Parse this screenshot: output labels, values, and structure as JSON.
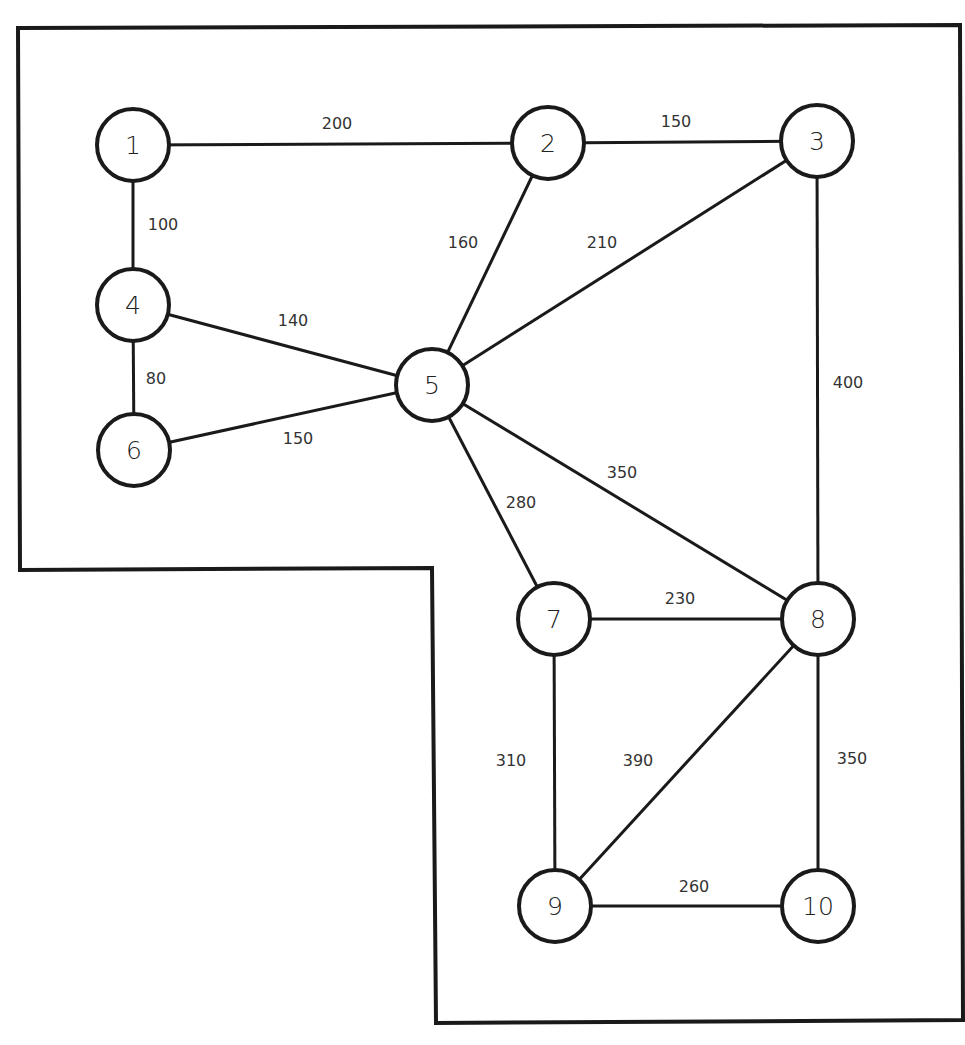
{
  "diagram": {
    "type": "weighted-undirected-graph",
    "colors": {
      "stroke": "#1a1a1a",
      "text": "#333333",
      "background": "#ffffff"
    },
    "boundary": [
      [
        18,
        28
      ],
      [
        960,
        25
      ],
      [
        963,
        1020
      ],
      [
        436,
        1023
      ],
      [
        432,
        568
      ],
      [
        20,
        570
      ]
    ],
    "nodes": [
      {
        "id": "1",
        "label": "1",
        "x": 133,
        "y": 145
      },
      {
        "id": "2",
        "label": "2",
        "x": 548,
        "y": 143
      },
      {
        "id": "3",
        "label": "3",
        "x": 817,
        "y": 141
      },
      {
        "id": "4",
        "label": "4",
        "x": 133,
        "y": 305
      },
      {
        "id": "5",
        "label": "5",
        "x": 432,
        "y": 385
      },
      {
        "id": "6",
        "label": "6",
        "x": 134,
        "y": 450
      },
      {
        "id": "7",
        "label": "7",
        "x": 554,
        "y": 619
      },
      {
        "id": "8",
        "label": "8",
        "x": 818,
        "y": 619
      },
      {
        "id": "9",
        "label": "9",
        "x": 555,
        "y": 906
      },
      {
        "id": "10",
        "label": "10",
        "x": 818,
        "y": 906
      }
    ],
    "edges": [
      {
        "from": "1",
        "to": "2",
        "weight": "200",
        "lx": 337,
        "ly": 123
      },
      {
        "from": "2",
        "to": "3",
        "weight": "150",
        "lx": 676,
        "ly": 121
      },
      {
        "from": "1",
        "to": "4",
        "weight": "100",
        "lx": 163,
        "ly": 224
      },
      {
        "from": "2",
        "to": "5",
        "weight": "160",
        "lx": 463,
        "ly": 242
      },
      {
        "from": "3",
        "to": "5",
        "weight": "210",
        "lx": 602,
        "ly": 242
      },
      {
        "from": "4",
        "to": "5",
        "weight": "140",
        "lx": 293,
        "ly": 320
      },
      {
        "from": "4",
        "to": "6",
        "weight": "80",
        "lx": 156,
        "ly": 378
      },
      {
        "from": "6",
        "to": "5",
        "weight": "150",
        "lx": 298,
        "ly": 438
      },
      {
        "from": "3",
        "to": "8",
        "weight": "400",
        "lx": 848,
        "ly": 382
      },
      {
        "from": "5",
        "to": "8",
        "weight": "350",
        "lx": 622,
        "ly": 472
      },
      {
        "from": "5",
        "to": "7",
        "weight": "280",
        "lx": 521,
        "ly": 502
      },
      {
        "from": "7",
        "to": "8",
        "weight": "230",
        "lx": 680,
        "ly": 598
      },
      {
        "from": "7",
        "to": "9",
        "weight": "310",
        "lx": 511,
        "ly": 760
      },
      {
        "from": "8",
        "to": "9",
        "weight": "390",
        "lx": 638,
        "ly": 760
      },
      {
        "from": "8",
        "to": "10",
        "weight": "350",
        "lx": 852,
        "ly": 758
      },
      {
        "from": "9",
        "to": "10",
        "weight": "260",
        "lx": 694,
        "ly": 886
      }
    ]
  }
}
